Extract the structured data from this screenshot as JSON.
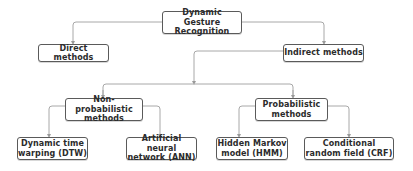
{
  "diagram": {
    "type": "hierarchy-tree",
    "root": {
      "id": "root",
      "label_line1": "Dynamic Gesture",
      "label_line2": "Recognition"
    },
    "level1": [
      {
        "id": "direct",
        "label": "Direct methods"
      },
      {
        "id": "indirect",
        "label": "Indirect methods"
      }
    ],
    "level2": [
      {
        "id": "nonprob",
        "label_line1": "Non-probabilistic",
        "label_line2": "methods",
        "parent": "indirect"
      },
      {
        "id": "prob",
        "label_line1": "Probabilistic",
        "label_line2": "methods",
        "parent": "indirect"
      }
    ],
    "level3": [
      {
        "id": "dtw",
        "label_line1": "Dynamic time",
        "label_line2": "warping (DTW)",
        "parent": "nonprob"
      },
      {
        "id": "ann",
        "label_line1": "Artificial neural",
        "label_line2": "network (ANN)",
        "parent": "nonprob"
      },
      {
        "id": "hmm",
        "label_line1": "Hidden Markov",
        "label_line2": "model (HMM)",
        "parent": "prob"
      },
      {
        "id": "crf",
        "label_line1": "Conditional",
        "label_line2": "random field (CRF)",
        "parent": "prob"
      }
    ],
    "colors": {
      "border": "#5a5a5a",
      "connector": "#9a9a9a",
      "text": "#2b2b2b",
      "background": "#ffffff"
    }
  }
}
